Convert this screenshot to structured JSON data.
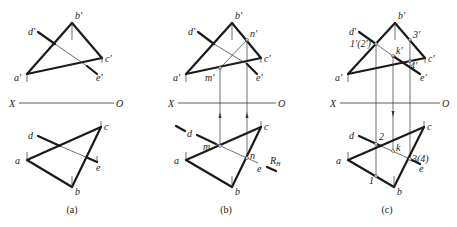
{
  "figure": {
    "axis": {
      "x_label": "X",
      "o_label": "O"
    }
  },
  "panels": [
    {
      "caption": "(a)",
      "labels": {
        "b_prime": "b'",
        "d_prime": "d'",
        "c_prime": "c'",
        "a_prime": "a'",
        "e_prime": "e'",
        "x": "X",
        "o": "O",
        "d": "d",
        "c": "c",
        "a": "a",
        "e": "e",
        "b": "b"
      }
    },
    {
      "caption": "(b)",
      "labels": {
        "b_prime": "b'",
        "d_prime": "d'",
        "n_prime": "n'",
        "c_prime": "c'",
        "a_prime": "a'",
        "m_prime": "m'",
        "e_prime": "e'",
        "x": "X",
        "o": "O",
        "d": "d",
        "c": "c",
        "m": "m",
        "n": "n",
        "a": "a",
        "e": "e",
        "b": "b",
        "rh": "R",
        "rh_sub": "H"
      }
    },
    {
      "caption": "(c)",
      "labels": {
        "b_prime": "b'",
        "d_prime": "d'",
        "p12_prime": "1'(2')",
        "three_prime": "3'",
        "k_prime": "k'",
        "c_prime": "c'",
        "four_prime": "4'",
        "a_prime": "a'",
        "e_prime": "e'",
        "x": "X",
        "o": "O",
        "d": "d",
        "two": "2",
        "k": "k",
        "c": "c",
        "p34": "3(4)",
        "a": "a",
        "e": "e",
        "one": "1",
        "b": "b"
      }
    }
  ]
}
